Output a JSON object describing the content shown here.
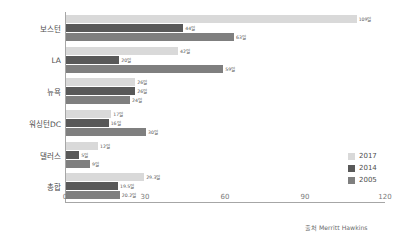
{
  "chart_data": {
    "type": "bar",
    "orientation": "horizontal",
    "title": "",
    "xlabel": "",
    "ylabel": "",
    "xlim": [
      0,
      120
    ],
    "xticks": [
      "0",
      "30",
      "60",
      "90",
      "120"
    ],
    "grid": false,
    "legend_position": "right-inside",
    "categories": [
      "보스턴",
      "LA",
      "뉴욕",
      "워싱턴DC",
      "댈러스",
      "총합"
    ],
    "series": [
      {
        "name": "2017",
        "color": "#d9d9d9",
        "values": [
          109,
          42,
          26,
          17,
          12,
          29.3
        ],
        "labels": [
          "109일",
          "42일",
          "26일",
          "17일",
          "12일",
          "29.3일"
        ]
      },
      {
        "name": "2014",
        "color": "#595959",
        "values": [
          44,
          20,
          26,
          16,
          5,
          19.5
        ],
        "labels": [
          "44일",
          "20일",
          "26일",
          "16일",
          "5일",
          "19.5일"
        ]
      },
      {
        "name": "2005",
        "color": "#7f7f7f",
        "values": [
          63,
          59,
          24,
          30,
          9,
          20.2
        ],
        "labels": [
          "63일",
          "59일",
          "24일",
          "30일",
          "9일",
          "20.2일"
        ]
      }
    ],
    "annotations": {
      "source": "출처 Merritt Hawkins"
    }
  },
  "legend": {
    "items": [
      {
        "label": "2017",
        "color": "#d9d9d9"
      },
      {
        "label": "2014",
        "color": "#595959"
      },
      {
        "label": "2005",
        "color": "#7f7f7f"
      }
    ]
  },
  "axis": {
    "x_ticks": [
      "0",
      "30",
      "60",
      "90",
      "120"
    ]
  },
  "source": {
    "text": "출처 Merritt Hawkins"
  }
}
